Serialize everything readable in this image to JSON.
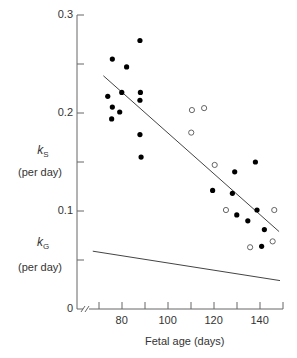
{
  "chart_data": {
    "type": "scatter",
    "title": "",
    "xlabel": "Fetal age (days)",
    "ylabel_upper": {
      "symbol": "k",
      "subscript": "S",
      "unit": "(per day)"
    },
    "ylabel_lower": {
      "symbol": "k",
      "subscript": "G",
      "unit": "(per day)"
    },
    "xlim": [
      70,
      150
    ],
    "ylim": [
      0,
      0.3
    ],
    "x_ticks": [
      70,
      80,
      90,
      100,
      110,
      120,
      130,
      140,
      150
    ],
    "x_tick_labels": [
      "80",
      "100",
      "120",
      "140"
    ],
    "x_tick_label_values": [
      80,
      100,
      120,
      140
    ],
    "y_ticks": [
      0,
      0.05,
      0.1,
      0.15,
      0.2,
      0.25,
      0.3
    ],
    "y_tick_labels": [
      "0",
      "0.1",
      "0.2",
      "0.3"
    ],
    "y_tick_label_values": [
      0,
      0.1,
      0.2,
      0.3
    ],
    "axis_break": true,
    "grid": false,
    "legend": null,
    "series": [
      {
        "name": "filled circles",
        "marker": "filled-circle",
        "points": [
          [
            73.8,
            0.217
          ],
          [
            75.8,
            0.255
          ],
          [
            75.5,
            0.194
          ],
          [
            75.8,
            0.206
          ],
          [
            79.0,
            0.201
          ],
          [
            79.9,
            0.221
          ],
          [
            82.0,
            0.247
          ],
          [
            87.8,
            0.274
          ],
          [
            88.0,
            0.221
          ],
          [
            87.8,
            0.213
          ],
          [
            87.8,
            0.178
          ],
          [
            88.3,
            0.155
          ],
          [
            119.4,
            0.121
          ],
          [
            129.0,
            0.14
          ],
          [
            128.0,
            0.118
          ],
          [
            129.9,
            0.096
          ],
          [
            134.7,
            0.09
          ],
          [
            138.0,
            0.15
          ],
          [
            138.7,
            0.101
          ],
          [
            141.9,
            0.081
          ],
          [
            140.7,
            0.064
          ]
        ]
      },
      {
        "name": "open circles",
        "marker": "open-circle",
        "points": [
          [
            110.1,
            0.18
          ],
          [
            110.4,
            0.203
          ],
          [
            115.7,
            0.205
          ],
          [
            120.3,
            0.147
          ],
          [
            125.2,
            0.101
          ],
          [
            135.7,
            0.063
          ],
          [
            145.5,
            0.069
          ],
          [
            146.2,
            0.101
          ]
        ]
      },
      {
        "name": "kS regression line",
        "type": "line",
        "points": [
          [
            71.9,
            0.238
          ],
          [
            148.3,
            0.079
          ]
        ]
      },
      {
        "name": "kG line",
        "type": "line",
        "points": [
          [
            67.3,
            0.059
          ],
          [
            148.7,
            0.029
          ]
        ]
      }
    ]
  },
  "labels": {
    "ks_symbol": "k",
    "ks_sub": "S",
    "ks_unit": "(per day)",
    "kg_symbol": "k",
    "kg_sub": "G",
    "kg_unit": "(per day)",
    "xlabel": "Fetal age (days)"
  },
  "colors": {
    "axis": "#666666",
    "marker": "#000000",
    "line": "#444444",
    "text": "#333333"
  }
}
